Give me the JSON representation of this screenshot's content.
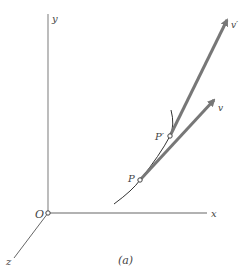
{
  "diagram": {
    "axes": {
      "x": "x",
      "y": "y",
      "z": "z",
      "origin": "O"
    },
    "points": {
      "p": "P",
      "p_prime": "P′"
    },
    "vectors": {
      "v": "v",
      "v_prime": "v′"
    },
    "caption": "(a)",
    "colors": {
      "axis": "#888888",
      "vector": "#777777",
      "curve": "#333333"
    }
  }
}
